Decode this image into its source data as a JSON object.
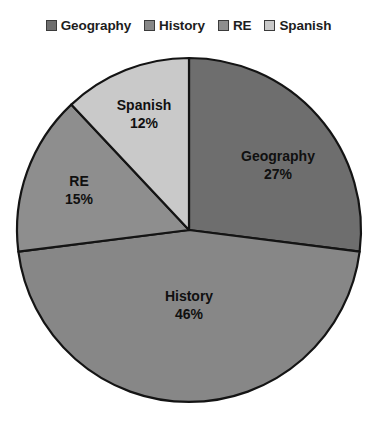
{
  "chart_data": {
    "type": "pie",
    "title": "",
    "categories": [
      "Geography",
      "History",
      "RE",
      "Spanish"
    ],
    "values": [
      27,
      46,
      15,
      12
    ],
    "value_unit": "%",
    "start_angle_deg": 0,
    "direction": "clockwise",
    "legend_position": "top",
    "grid": false,
    "data_labels": [
      "Geography\n27%",
      "History\n46%",
      "RE\n15%",
      "Spanish\n12%"
    ],
    "slice_colors": [
      "#6e6e6e",
      "#878787",
      "#8e8e8e",
      "#c9c9c9"
    ],
    "slice_border_color": "#141414",
    "background": "#ffffff"
  },
  "legend": {
    "items": [
      {
        "label": "Geography",
        "color": "#6e6e6e"
      },
      {
        "label": "History",
        "color": "#878787"
      },
      {
        "label": "RE",
        "color": "#8e8e8e"
      },
      {
        "label": "Spanish",
        "color": "#c9c9c9"
      }
    ]
  },
  "pie": {
    "center_x": 189,
    "center_y": 230,
    "radius": 172,
    "slices": [
      {
        "name": "Geography",
        "percent": 27,
        "pct_text": "27%",
        "color": "#6e6e6e",
        "start_deg": 0,
        "end_deg": 97.2
      },
      {
        "name": "History",
        "percent": 46,
        "pct_text": "46%",
        "color": "#878787",
        "start_deg": 97.2,
        "end_deg": 262.8
      },
      {
        "name": "RE",
        "percent": 15,
        "pct_text": "15%",
        "color": "#8e8e8e",
        "start_deg": 262.8,
        "end_deg": 316.8
      },
      {
        "name": "Spanish",
        "percent": 12,
        "pct_text": "12%",
        "color": "#c9c9c9",
        "start_deg": 316.8,
        "end_deg": 360
      }
    ]
  },
  "labels": {
    "geography": {
      "name": "Geography",
      "pct": "27%"
    },
    "history": {
      "name": "History",
      "pct": "46%"
    },
    "re": {
      "name": "RE",
      "pct": "15%"
    },
    "spanish": {
      "name": "Spanish",
      "pct": "12%"
    }
  }
}
